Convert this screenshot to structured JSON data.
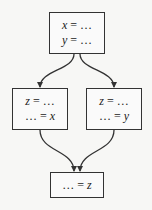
{
  "diagram": {
    "type": "control-flow-graph",
    "nodes": [
      {
        "id": "top",
        "lines": [
          {
            "lhs": "x",
            "op": " = ",
            "rhs": "…"
          },
          {
            "lhs": "y",
            "op": " = ",
            "rhs": "…"
          }
        ]
      },
      {
        "id": "left",
        "lines": [
          {
            "lhs": "z",
            "op": " = ",
            "rhs": "…"
          },
          {
            "lhs": "…",
            "op": " = ",
            "rhs": "x"
          }
        ]
      },
      {
        "id": "right",
        "lines": [
          {
            "lhs": "z",
            "op": " = ",
            "rhs": "…"
          },
          {
            "lhs": "…",
            "op": " = ",
            "rhs": "y"
          }
        ]
      },
      {
        "id": "bottom",
        "lines": [
          {
            "lhs": "…",
            "op": " = ",
            "rhs": "z"
          }
        ]
      }
    ],
    "edges": [
      {
        "from": "top",
        "to": "left"
      },
      {
        "from": "top",
        "to": "right"
      },
      {
        "from": "left",
        "to": "bottom"
      },
      {
        "from": "right",
        "to": "bottom"
      }
    ],
    "colors": {
      "stroke": "#333333",
      "background": "#f7f7f5"
    }
  }
}
